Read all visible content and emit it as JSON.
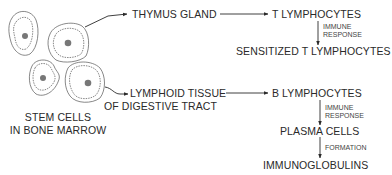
{
  "diagram": {
    "source": {
      "line1": "STEM CELLS",
      "line2": "IN BONE MARROW"
    },
    "t_path": {
      "organ": "THYMUS GLAND",
      "cell": "T LYMPHOCYTES",
      "step1_label": {
        "line1": "IMMUNE",
        "line2": "RESPONSE"
      },
      "result": "SENSITIZED T LYMPHOCYTES"
    },
    "b_path": {
      "organ": {
        "line1": "LYMPHOID TISSUE",
        "line2": "OF DIGESTIVE TRACT"
      },
      "cell": "B LYMPHOCYTES",
      "step1_label": {
        "line1": "IMMUNE",
        "line2": "RESPONSE"
      },
      "intermediate": "PLASMA CELLS",
      "step2_label": "FORMATION",
      "result": "IMMUNOGLOBULINS"
    },
    "colors": {
      "ink": "#2a2a2a",
      "background": "#ffffff"
    }
  }
}
